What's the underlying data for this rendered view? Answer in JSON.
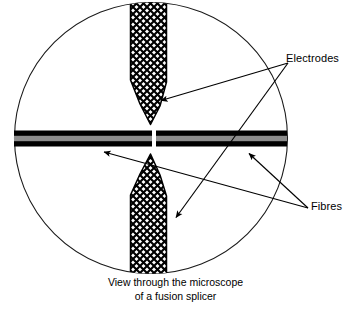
{
  "figure": {
    "kind": "technical-diagram",
    "caption_line1": "View through the microscope",
    "caption_line2": "of a fusion splicer"
  },
  "labels": {
    "electrodes": "Electrodes",
    "fibres": "Fibres"
  },
  "colors": {
    "outline": "#1a1a1a",
    "fibre_cladding": "#000000",
    "fibre_core": "#8c8c8c",
    "hatch": "#000000",
    "background": "#ffffff"
  },
  "geometry": {
    "field_circle": {
      "cx": 151,
      "cy": 138,
      "rx": 137,
      "ry": 136
    },
    "fibre_bar": {
      "left": 14,
      "right": 287,
      "top": 131,
      "bottom": 146,
      "core_top": 136,
      "core_bottom": 141
    },
    "splice_gap": {
      "x": 152,
      "width": 4
    },
    "electrode_top": {
      "left": 130,
      "right": 167,
      "top": 4,
      "shoulder": 81,
      "tip_y": 127
    },
    "electrode_bottom": {
      "left": 130,
      "right": 167,
      "bottom": 269,
      "shoulder": 193,
      "tip_y": 152
    }
  },
  "annotations": [
    {
      "name": "electrodes-to-top-electrode",
      "label": "Electrodes",
      "from": [
        288,
        63
      ],
      "to": [
        160,
        101
      ]
    },
    {
      "name": "electrodes-to-bottom-electrode",
      "label": "Electrodes",
      "from": [
        288,
        63
      ],
      "to": [
        175,
        218
      ]
    },
    {
      "name": "fibres-to-left-fibre",
      "label": "Fibres",
      "from": [
        308,
        208
      ],
      "to": [
        103,
        152
      ]
    },
    {
      "name": "fibres-to-right-fibre",
      "label": "Fibres",
      "from": [
        308,
        208
      ],
      "to": [
        248,
        153
      ]
    }
  ]
}
